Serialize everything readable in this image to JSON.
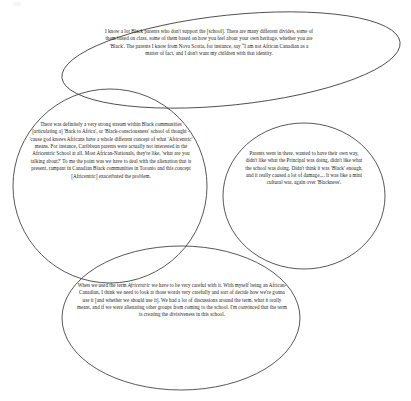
{
  "figure": {
    "type": "overlapping-ellipse-quote-diagram",
    "shape_count": 4,
    "background_color": "#ffffff",
    "outline_color": "#3a3a3a",
    "text_color": "#1a1a1a",
    "shapes": [
      {
        "name": "top-ellipse",
        "cx": 231,
        "cy": 60,
        "rx": 170,
        "ry": 45,
        "rotation_deg": -6
      },
      {
        "name": "left-circle",
        "cx": 110,
        "cy": 186,
        "rx": 97,
        "ry": 97,
        "rotation_deg": 0
      },
      {
        "name": "right-ellipse",
        "cx": 304,
        "cy": 196,
        "rx": 81,
        "ry": 73,
        "rotation_deg": 0
      },
      {
        "name": "bottom-ellipse",
        "cx": 181,
        "cy": 318,
        "rx": 119,
        "ry": 72,
        "rotation_deg": 0
      }
    ]
  },
  "quotes": {
    "top": "I know a lot Black parents who don't support the [school]. There are many different divides, some of them based on class, some of them based on how you feel about your own heritage, whether you are 'Black'. The parents I know from Nova Scotia, for instance, say “I am not African Canadian as a matter of fact, and I don't want my children with that identity.",
    "left": "There was definitely a very strong stream within Black communities [articulating a] 'Back to Africa', or 'Black-consciousness' school of thought - 'cause god knows Africans have a whole different concept of what 'Africentric' means. For instance, Caribbean parents were actually not interested in the Africentric School at all. Most African-Nationals, they're like, 'what are you talking about?' To me the point was we have to deal with the alienation that is present, rampant in Canadian Black communities in Toronto and this concept [Africentric] exacerbated the problem.",
    "right": "Parents went in there, wanted to have their own way, didn't like what the Principal was doing, didn't like what the school was doing. Didn't think it was 'Black' enough, and it really caused a lot of damage.... It was like a mini cultural war, again over 'Blackness'.",
    "bottom_part1": "When we used the term ",
    "bottom_italic": "Africentric",
    "bottom_part2": " we have to be very careful with it. With myself being an African-Canadian, I think we need to look at those words very carefully and sort of decide how we're gonna use it [and whether we should use it]. We had a lot of discussions around the term, what it really meant, and if we were alienating other groups from coming to the school. I'm convinced that the term is creating the divisiveness in this school."
  }
}
